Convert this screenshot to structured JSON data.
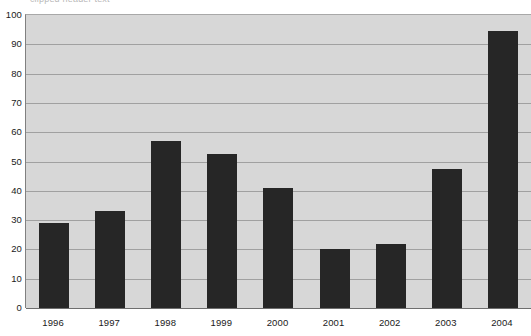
{
  "top_strip": {
    "clipped_text": "— clipped header text —"
  },
  "chart_data": {
    "type": "bar",
    "title": "",
    "subtitle": "",
    "xlabel": "",
    "ylabel": "",
    "categories": [
      "1996",
      "1997",
      "1998",
      "1999",
      "2000",
      "2001",
      "2002",
      "2003",
      "2004"
    ],
    "values": [
      29,
      33,
      57,
      52.5,
      41,
      20,
      22,
      47.5,
      94.5
    ],
    "ylim": [
      0,
      100
    ],
    "ytick_step": 10,
    "yticks": [
      "0",
      "10",
      "20",
      "30",
      "40",
      "50",
      "60",
      "70",
      "80",
      "90",
      "100"
    ],
    "grid": true,
    "grid_axis": "y",
    "legend": false,
    "legend_position": "none",
    "series": [
      {
        "name": "",
        "values": [
          29,
          33,
          57,
          52.5,
          41,
          20,
          22,
          47.5,
          94.5
        ]
      }
    ],
    "colors": {
      "bar": "#262626",
      "plot_background": "#d7d7d7",
      "figure_background": "#ffffff",
      "gridline": "#a0a0a0",
      "axis_line": "#6e6e6e",
      "tick_text": "#1a1a1a"
    }
  }
}
